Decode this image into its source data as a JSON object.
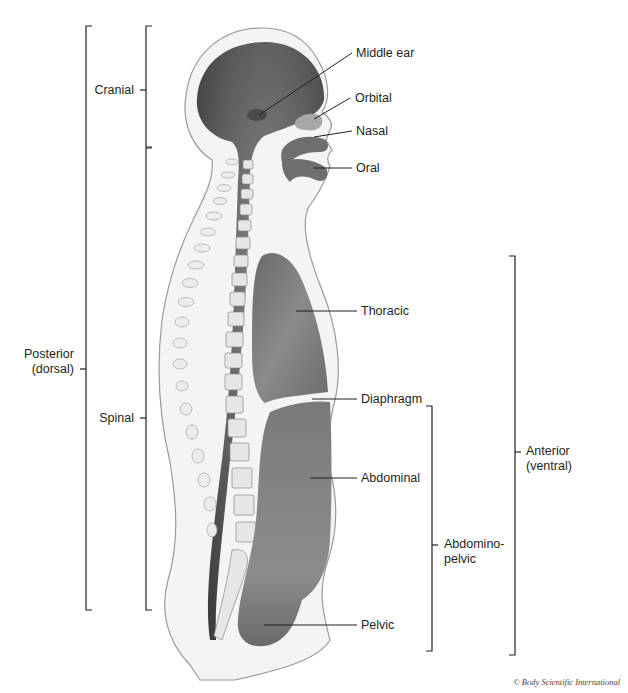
{
  "diagram": {
    "labels": {
      "middle_ear": "Middle ear",
      "orbital": "Orbital",
      "nasal": "Nasal",
      "oral": "Oral",
      "thoracic": "Thoracic",
      "diaphragm": "Diaphragm",
      "abdominal": "Abdominal",
      "pelvic": "Pelvic",
      "cranial": "Cranial",
      "spinal": "Spinal",
      "posterior_line1": "Posterior",
      "posterior_line2": "(dorsal)",
      "anterior_line1": "Anterior",
      "anterior_line2": "(ventral)",
      "abdominopelvic_line1": "Abdomino-",
      "abdominopelvic_line2": "pelvic"
    },
    "brackets": [
      {
        "name": "posterior-dorsal",
        "x": 86,
        "y1": 26,
        "y2": 610,
        "side": "left"
      },
      {
        "name": "cranial",
        "x": 146,
        "y1": 26,
        "y2": 147,
        "side": "left"
      },
      {
        "name": "spinal",
        "x": 146,
        "y1": 148,
        "y2": 610,
        "side": "left"
      },
      {
        "name": "anterior-ventral",
        "x": 515,
        "y1": 256,
        "y2": 655,
        "side": "right"
      },
      {
        "name": "abdominopelvic",
        "x": 432,
        "y1": 406,
        "y2": 651,
        "side": "right"
      }
    ],
    "colors": {
      "body_fill": "#f4f4f4",
      "body_outline": "#9a9a9a",
      "cavity_dark": "#5a5a5a",
      "cavity_mid": "#7d7d7d",
      "cavity_light": "#a8a8a8",
      "line": "#231f20"
    },
    "credit": "© Body Scientific International"
  }
}
